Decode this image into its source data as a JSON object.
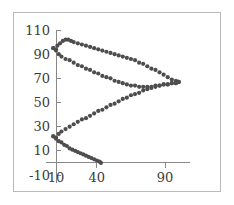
{
  "figure": {
    "background_color": "#ffffff",
    "frame_color": "#b9b9b9",
    "axis_color": "#888888"
  },
  "chart_data": {
    "type": "scatter",
    "title": "",
    "subtitle": "",
    "xlabel": "",
    "ylabel": "",
    "xlim": [
      0,
      110
    ],
    "ylim": [
      -10,
      110
    ],
    "grid": false,
    "legend": null,
    "marker": "dot",
    "marker_color": "#4d4d4d",
    "marker_size": 2.1,
    "xticks": [
      10,
      40,
      90
    ],
    "xtick_labels": [
      "10",
      "40",
      "90"
    ],
    "yticks": [
      -10,
      10,
      30,
      50,
      70,
      90,
      110
    ],
    "ytick_labels": [
      "-10",
      "10",
      "30",
      "50",
      "70",
      "90",
      "110"
    ],
    "axis_origin": {
      "x": 10,
      "y": 0
    },
    "series": [
      {
        "name": "upper-rising-branch",
        "comment": "rises from left anchor to a peak then descends to right apex",
        "x": [
          8,
          10,
          11,
          13,
          15,
          17,
          19,
          21,
          23,
          26,
          29,
          32,
          35,
          38,
          41,
          44,
          47,
          50,
          53,
          56,
          59,
          62,
          65,
          68,
          71,
          74,
          77,
          80,
          83,
          86,
          89,
          92,
          95,
          98,
          100
        ],
        "y": [
          95,
          94,
          97,
          99,
          101,
          102,
          102,
          101,
          100,
          99,
          98,
          97,
          96,
          95,
          94,
          93,
          92,
          91,
          90,
          89,
          88,
          87,
          86,
          85,
          83,
          82,
          80,
          78,
          77,
          75,
          73,
          71,
          69,
          68,
          67
        ]
      },
      {
        "name": "upper-falling-branch",
        "comment": "descends from left anchor to mid-right then turns up to right apex",
        "x": [
          8,
          10,
          12,
          14,
          17,
          20,
          23,
          26,
          29,
          32,
          35,
          38,
          41,
          44,
          47,
          50,
          53,
          56,
          59,
          62,
          65,
          68,
          71,
          74,
          77,
          80,
          83,
          86,
          89,
          92,
          95,
          98,
          100
        ],
        "y": [
          95,
          93,
          90,
          88,
          86,
          85,
          83,
          81,
          80,
          78,
          77,
          75,
          74,
          72,
          71,
          70,
          68,
          67,
          66,
          65,
          64,
          64,
          63,
          63,
          63,
          63,
          64,
          64,
          65,
          65,
          66,
          66,
          67
        ]
      },
      {
        "name": "lower-rising-branch",
        "comment": "rises from lower-left anchor up to the right apex",
        "x": [
          8,
          10,
          12,
          14,
          17,
          20,
          23,
          26,
          29,
          32,
          35,
          38,
          41,
          44,
          47,
          50,
          53,
          56,
          59,
          62,
          65,
          68,
          71,
          74,
          77,
          80,
          83,
          86,
          89,
          92,
          95,
          98,
          100
        ],
        "y": [
          22,
          21,
          24,
          26,
          28,
          30,
          32,
          34,
          36,
          37,
          39,
          41,
          43,
          44,
          46,
          48,
          49,
          51,
          53,
          54,
          56,
          57,
          58,
          60,
          61,
          62,
          63,
          64,
          65,
          65,
          66,
          66,
          67
        ]
      },
      {
        "name": "lower-falling-branch",
        "comment": "short branch descending from lower-left anchor to the x-axis",
        "x": [
          8,
          10,
          12,
          14,
          16,
          18,
          20,
          22,
          24,
          26,
          28,
          30,
          32,
          34,
          36,
          38,
          40,
          42,
          43
        ],
        "y": [
          22,
          20,
          18,
          17,
          15,
          14,
          12,
          11,
          10,
          9,
          8,
          7,
          6,
          5,
          4,
          3,
          2,
          1,
          0
        ]
      }
    ]
  }
}
